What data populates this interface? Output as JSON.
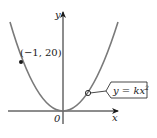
{
  "figure": {
    "type": "graph of parabola",
    "axis_labels": {
      "x": "x",
      "y": "y",
      "origin": "0"
    },
    "point": {
      "label": "(−1, 20)",
      "x": -1,
      "y": 20
    },
    "equation_label": {
      "lhs": "y = kx",
      "exponent": "2",
      "full": "y = kx^2"
    },
    "colors": {
      "curve": "#7a7a7a",
      "axes": "#1a1a1a",
      "point": "#1a1a1a",
      "text": "#1a1a1a"
    }
  }
}
